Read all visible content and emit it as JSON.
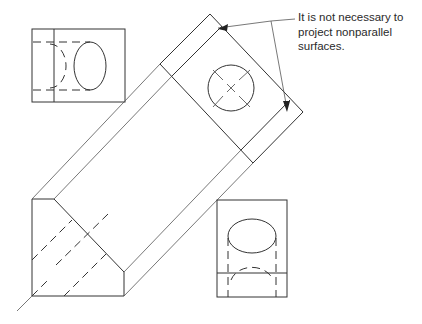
{
  "figure": {
    "annotation": {
      "lines": [
        "It is not necessary to",
        "project nonparallel",
        "surfaces."
      ]
    },
    "views": [
      {
        "name": "top-left-view",
        "features": [
          "rectangle",
          "vertical edge line",
          "ellipse",
          "hidden half-ellipse",
          "hidden lines"
        ]
      },
      {
        "name": "front-view",
        "features": [
          "chamfered polygon",
          "hidden diagonal lines"
        ]
      },
      {
        "name": "auxiliary-view",
        "features": [
          "rectangle face rotated 45°",
          "circle hole",
          "center cross"
        ]
      },
      {
        "name": "right-view",
        "features": [
          "rectangle",
          "horizontal edge line",
          "ellipse",
          "hidden half-ellipse",
          "hidden lines"
        ]
      }
    ],
    "colors": {
      "line": "#333333",
      "text": "#2a2a2a",
      "background": "#ffffff"
    }
  }
}
